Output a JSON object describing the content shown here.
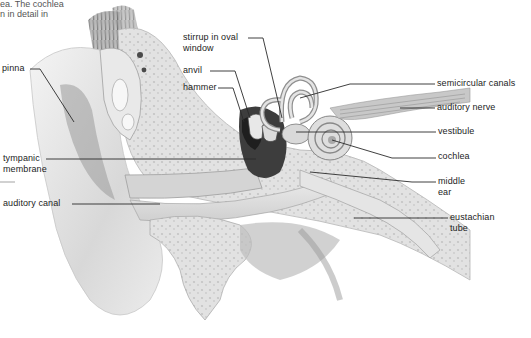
{
  "caption": {
    "line1": "ea. The cochlea",
    "line2": "n in detail in"
  },
  "labels": {
    "pinna": "pinna",
    "tympanic_membrane_1": "tympanic",
    "tympanic_membrane_2": "membrane",
    "auditory_canal": "auditory canal",
    "stirrup_1": "stirrup in oval",
    "stirrup_2": "window",
    "anvil": "anvil",
    "hammer": "hammer",
    "semicircular_canals": "semicircular canals",
    "auditory_nerve": "auditory nerve",
    "vestibule": "vestibule",
    "cochlea": "cochlea",
    "middle_ear_1": "middle",
    "middle_ear_2": "ear",
    "eustachian_tube_1": "eustachian",
    "eustachian_tube_2": "tube"
  },
  "colors": {
    "line": "#2a2a2a",
    "bone": "#e6e6e6",
    "shade": "#bdbdbd",
    "dark": "#3a3a3a"
  }
}
